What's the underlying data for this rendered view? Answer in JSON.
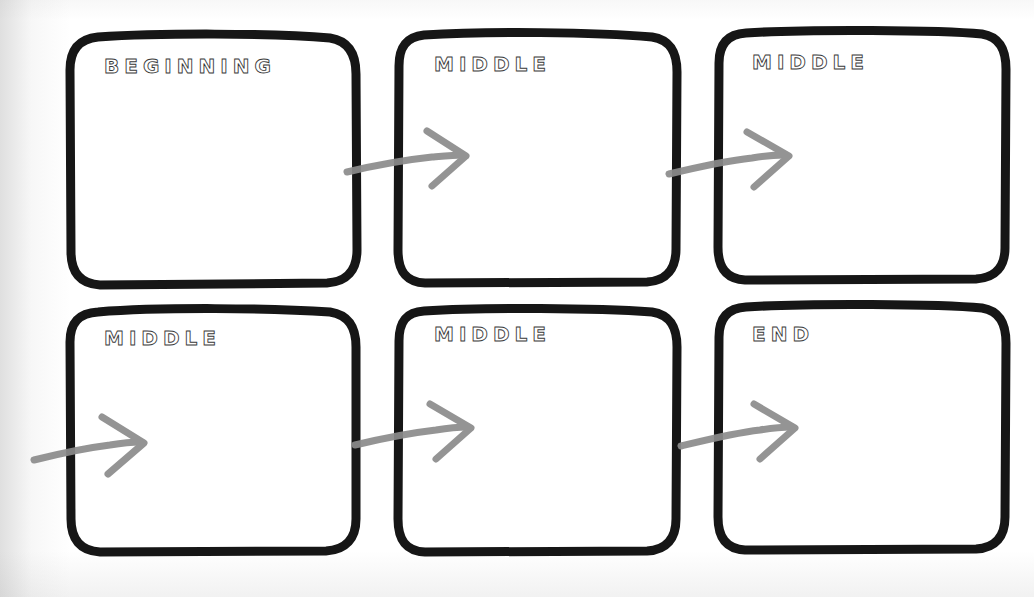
{
  "page": {
    "background_color": "#ffffff",
    "box_stroke_color": "#161616",
    "arrow_stroke_color": "#8c8c8c",
    "label_stroke_color": "#3a3a3a",
    "width": 1034,
    "height": 597,
    "rows": 2,
    "columns": 3
  },
  "cells": [
    {
      "id": "cell-1",
      "label": "BEGINNING",
      "row": 1,
      "column": 1,
      "content": "",
      "x": 70,
      "y": 34,
      "w": 285,
      "h": 252
    },
    {
      "id": "cell-2",
      "label": "MIDDLE",
      "row": 1,
      "column": 2,
      "content": "",
      "x": 398,
      "y": 32,
      "w": 278,
      "h": 252
    },
    {
      "id": "cell-3",
      "label": "MIDDLE",
      "row": 1,
      "column": 3,
      "content": "",
      "x": 718,
      "y": 30,
      "w": 288,
      "h": 250
    },
    {
      "id": "cell-4",
      "label": "MIDDLE",
      "row": 2,
      "column": 1,
      "content": "",
      "x": 70,
      "y": 308,
      "w": 285,
      "h": 244
    },
    {
      "id": "cell-5",
      "label": "MIDDLE",
      "row": 2,
      "column": 2,
      "content": "",
      "x": 398,
      "y": 308,
      "w": 278,
      "h": 244
    },
    {
      "id": "cell-6",
      "label": "END",
      "row": 2,
      "column": 3,
      "content": "",
      "x": 718,
      "y": 304,
      "w": 288,
      "h": 246
    }
  ],
  "connectors": [
    {
      "id": "arrow-1",
      "from": "cell-1",
      "to": "cell-2",
      "direction": "right"
    },
    {
      "id": "arrow-2",
      "from": "cell-2",
      "to": "cell-3",
      "direction": "right"
    },
    {
      "id": "arrow-3",
      "from": "cell-3",
      "to": "cell-4",
      "direction": "right"
    },
    {
      "id": "arrow-4",
      "from": "cell-4",
      "to": "cell-5",
      "direction": "right"
    },
    {
      "id": "arrow-5",
      "from": "cell-5",
      "to": "cell-6",
      "direction": "right"
    }
  ]
}
